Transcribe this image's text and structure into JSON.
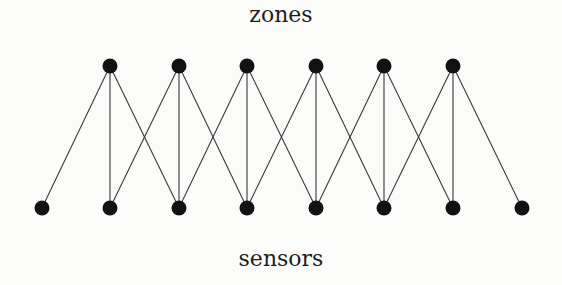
{
  "diagram": {
    "top_label": "zones",
    "bottom_label": "sensors",
    "node_color": "#121212",
    "edge_color": "#3a3a3a",
    "top_nodes": [
      {
        "id": "zone-1",
        "x": 110,
        "y": 66
      },
      {
        "id": "zone-2",
        "x": 179,
        "y": 66
      },
      {
        "id": "zone-3",
        "x": 247,
        "y": 66
      },
      {
        "id": "zone-4",
        "x": 316,
        "y": 66
      },
      {
        "id": "zone-5",
        "x": 384,
        "y": 66
      },
      {
        "id": "zone-6",
        "x": 453,
        "y": 66
      }
    ],
    "bottom_nodes": [
      {
        "id": "sensor-1",
        "x": 42,
        "y": 208
      },
      {
        "id": "sensor-2",
        "x": 110,
        "y": 208
      },
      {
        "id": "sensor-3",
        "x": 179,
        "y": 208
      },
      {
        "id": "sensor-4",
        "x": 247,
        "y": 208
      },
      {
        "id": "sensor-5",
        "x": 316,
        "y": 208
      },
      {
        "id": "sensor-6",
        "x": 384,
        "y": 208
      },
      {
        "id": "sensor-7",
        "x": 453,
        "y": 208
      },
      {
        "id": "sensor-8",
        "x": 522,
        "y": 208
      }
    ],
    "edges": [
      [
        "zone-1",
        "sensor-1"
      ],
      [
        "zone-1",
        "sensor-2"
      ],
      [
        "zone-1",
        "sensor-3"
      ],
      [
        "zone-2",
        "sensor-2"
      ],
      [
        "zone-2",
        "sensor-3"
      ],
      [
        "zone-2",
        "sensor-4"
      ],
      [
        "zone-3",
        "sensor-3"
      ],
      [
        "zone-3",
        "sensor-4"
      ],
      [
        "zone-3",
        "sensor-5"
      ],
      [
        "zone-4",
        "sensor-4"
      ],
      [
        "zone-4",
        "sensor-5"
      ],
      [
        "zone-4",
        "sensor-6"
      ],
      [
        "zone-5",
        "sensor-5"
      ],
      [
        "zone-5",
        "sensor-6"
      ],
      [
        "zone-5",
        "sensor-7"
      ],
      [
        "zone-6",
        "sensor-6"
      ],
      [
        "zone-6",
        "sensor-7"
      ],
      [
        "zone-6",
        "sensor-8"
      ]
    ]
  }
}
